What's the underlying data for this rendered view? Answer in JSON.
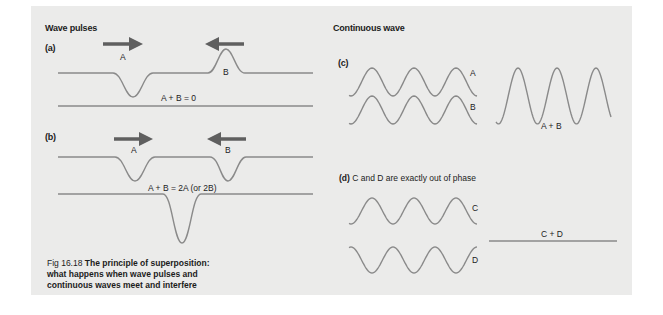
{
  "figure": {
    "caption_number": "Fig 16.18",
    "caption_text_line1": "The principle of superposition:",
    "caption_text_line2": "what happens when wave pulses and",
    "caption_text_line3": "continuous waves meet and interfere"
  },
  "left": {
    "heading": "Wave pulses",
    "a": {
      "label": "(a)",
      "pulse_a": "A",
      "pulse_b": "B",
      "result": "A + B = 0"
    },
    "b": {
      "label": "(b)",
      "pulse_a": "A",
      "pulse_b": "B",
      "result": "A + B = 2A (or 2B)"
    }
  },
  "right": {
    "heading": "Continuous wave",
    "c": {
      "label": "(c)",
      "wave_a": "A",
      "wave_b": "B",
      "sum": "A + B"
    },
    "d": {
      "label_bold": "(d)",
      "label_text": "C and D are exactly out of phase",
      "wave_c": "C",
      "wave_d": "D",
      "sum": "C + D"
    }
  },
  "colors": {
    "wave": "#8a8a8a",
    "arrow": "#5f5f5f",
    "background": "#ebebea"
  }
}
